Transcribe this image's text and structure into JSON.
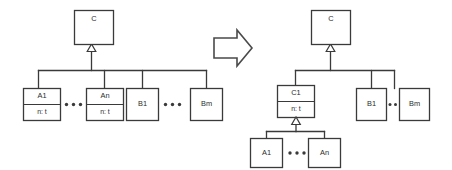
{
  "diagram": {
    "stroke_color": "#3a3a3a",
    "background_color": "#ffffff",
    "arrow_color": "#4a4a4a",
    "before": {
      "label": "before",
      "superclass": {
        "name": "C",
        "attributes": []
      },
      "subclasses": [
        {
          "name": "A1",
          "attributes": [
            "n: t"
          ]
        },
        {
          "name": "An",
          "attributes": [
            "n: t"
          ]
        },
        {
          "name": "B1",
          "attributes": []
        },
        {
          "name": "Bm",
          "attributes": []
        }
      ],
      "ellipses": [
        {
          "between": "A1-An",
          "dots": 3
        },
        {
          "between": "B1-Bm",
          "dots": 3
        }
      ]
    },
    "after": {
      "label": "after",
      "superclass": {
        "name": "C",
        "attributes": []
      },
      "intermediate": {
        "name": "C1",
        "attributes": [
          "n: t"
        ]
      },
      "intermediate_children": [
        {
          "name": "A1",
          "attributes": []
        },
        {
          "name": "An",
          "attributes": []
        }
      ],
      "siblings": [
        {
          "name": "B1",
          "attributes": []
        },
        {
          "name": "Bm",
          "attributes": []
        }
      ],
      "ellipses": [
        {
          "between": "A1-An",
          "dots": 3
        },
        {
          "between": "B1-Bm",
          "dots": 2
        }
      ]
    },
    "transform_arrow": {
      "direction": "right",
      "glyph": "arrow-right-outline"
    }
  }
}
